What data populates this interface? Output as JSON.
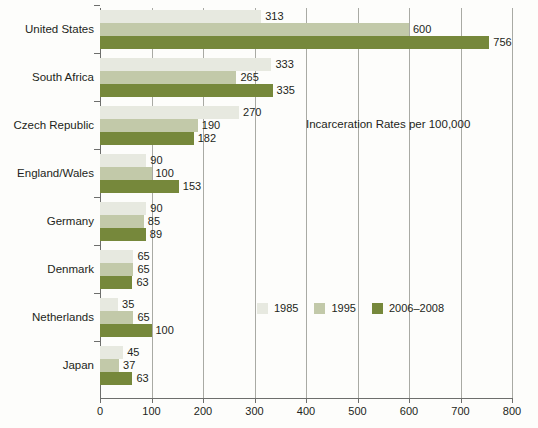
{
  "chart_data": {
    "type": "bar",
    "orientation": "horizontal",
    "title": "Incarceration Rates per 100,000",
    "xlabel": "",
    "ylabel": "",
    "xlim": [
      0,
      800
    ],
    "xticks": [
      0,
      100,
      200,
      300,
      400,
      500,
      600,
      700,
      800
    ],
    "grid": true,
    "legend_position": "center-right",
    "categories": [
      "United States",
      "South Africa",
      "Czech Republic",
      "England/Wales",
      "Germany",
      "Denmark",
      "Netherlands",
      "Japan"
    ],
    "series": [
      {
        "name": "1985",
        "color": "#e7e9e0",
        "values": [
          313,
          333,
          270,
          90,
          90,
          65,
          35,
          45
        ]
      },
      {
        "name": "1995",
        "color": "#c2c9a9",
        "values": [
          600,
          265,
          190,
          100,
          85,
          65,
          65,
          37
        ]
      },
      {
        "name": "2006–2008",
        "color": "#76883b",
        "values": [
          756,
          335,
          182,
          153,
          89,
          63,
          100,
          63
        ]
      }
    ]
  },
  "axis": {
    "tick_labels": [
      "0",
      "100",
      "200",
      "300",
      "400",
      "500",
      "600",
      "700",
      "800"
    ]
  },
  "legend": {
    "items": [
      {
        "label": "1985",
        "color": "#e7e9e0"
      },
      {
        "label": "1995",
        "color": "#c2c9a9"
      },
      {
        "label": "2006–2008",
        "color": "#76883b"
      }
    ]
  }
}
